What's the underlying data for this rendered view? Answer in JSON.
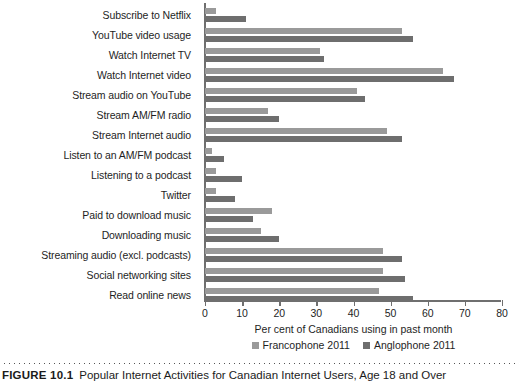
{
  "figure": {
    "number_label": "FIGURE 10.1",
    "caption": "Popular Internet Activities for Canadian Internet Users, Age 18 and Over"
  },
  "colors": {
    "francophone": "#9a9a9a",
    "anglophone": "#6e6e6e",
    "axis": "#6f6f6f",
    "text": "#1e1e1e"
  },
  "chart_data": {
    "type": "bar",
    "orientation": "horizontal",
    "title": "",
    "xlabel": "Per cent of Canadians using in past month",
    "ylabel": "",
    "xlim": [
      0,
      80
    ],
    "xticks": [
      0,
      10,
      20,
      30,
      40,
      50,
      60,
      70,
      80
    ],
    "xtick_labels": [
      "0",
      "10",
      "20",
      "30",
      "40",
      "50",
      "60",
      "70",
      "80"
    ],
    "grid": false,
    "legend_position": "bottom",
    "categories": [
      "Subscribe to Netflix",
      "YouTube video usage",
      "Watch Internet TV",
      "Watch Internet video",
      "Stream audio on YouTube",
      "Stream AM/FM radio",
      "Stream Internet audio",
      "Listen to an AM/FM podcast",
      "Listening to a podcast",
      "Twitter",
      "Paid to download music",
      "Downloading music",
      "Streaming audio (excl. podcasts)",
      "Social networking sites",
      "Read online news"
    ],
    "series": [
      {
        "name": "Francophone 2011",
        "color": "#9a9a9a",
        "values": [
          3,
          53,
          31,
          64,
          41,
          17,
          49,
          2,
          3,
          3,
          18,
          15,
          48,
          48,
          47
        ]
      },
      {
        "name": "Anglophone 2011",
        "color": "#6e6e6e",
        "values": [
          11,
          56,
          32,
          67,
          43,
          20,
          53,
          5,
          10,
          8,
          13,
          20,
          53,
          54,
          56
        ]
      }
    ]
  }
}
